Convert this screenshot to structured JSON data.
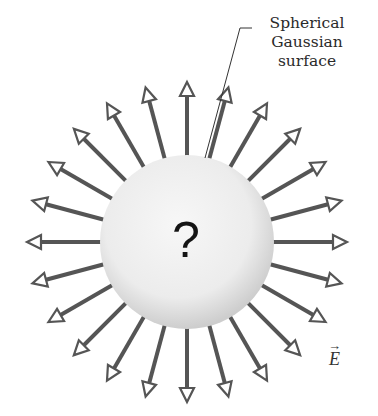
{
  "diagram": {
    "title_label": [
      "Spherical",
      "Gaussian",
      "surface"
    ],
    "center_symbol": "?",
    "field_label": "E",
    "field_label_arrow": "→",
    "sphere": {
      "cx": 187,
      "cy": 242,
      "r": 87,
      "fill_light": "#f6f6f6",
      "fill_dark": "#cfcfcf"
    },
    "arrows": {
      "count": 24,
      "angle_step_deg": 15,
      "start_radius": 87,
      "tip_radius": 160,
      "color": "#555555",
      "head_fill": "#ffffff",
      "stroke_width": 4
    },
    "leader_line": {
      "x1": 205,
      "y1": 158,
      "x2": 240,
      "y2": 28,
      "x3": 252,
      "y3": 28,
      "color": "#333333"
    }
  }
}
